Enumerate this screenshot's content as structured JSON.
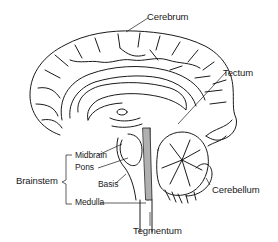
{
  "diagram": {
    "labels": {
      "cerebrum": "Cerebrum",
      "tectum": "Tectum",
      "midbrain": "Midbrain",
      "pons": "Pons",
      "basis": "Basis",
      "brainstem": "Brainstem",
      "medulla": "Medulla",
      "cerebellum": "Cerebellum",
      "tegmentum": "Tegmentum"
    },
    "colors": {
      "line": "#1a1a1a",
      "background": "#ffffff",
      "shading": "#9a9a9a"
    }
  }
}
